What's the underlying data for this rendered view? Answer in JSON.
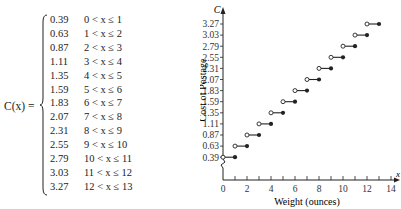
{
  "formula": {
    "lhs": "C(x) =",
    "cases": [
      {
        "value": "0.39",
        "condition": "0 < x ≤ 1"
      },
      {
        "value": "0.63",
        "condition": "1 < x ≤ 2"
      },
      {
        "value": "0.87",
        "condition": "2 < x ≤ 3"
      },
      {
        "value": "1.11",
        "condition": "3 < x ≤ 4"
      },
      {
        "value": "1.35",
        "condition": "4 < x ≤ 5"
      },
      {
        "value": "1.59",
        "condition": "5 < x ≤ 6"
      },
      {
        "value": "1.83",
        "condition": "6 < x ≤ 7"
      },
      {
        "value": "2.07",
        "condition": "7 < x ≤ 8"
      },
      {
        "value": "2.31",
        "condition": "8 < x ≤ 9"
      },
      {
        "value": "2.55",
        "condition": "9 < x ≤ 10"
      },
      {
        "value": "2.79",
        "condition": "10 < x ≤ 11"
      },
      {
        "value": "3.03",
        "condition": "11 < x ≤ 12"
      },
      {
        "value": "3.27",
        "condition": "12 < x ≤ 13"
      }
    ]
  },
  "chart_data": {
    "type": "step",
    "title": "",
    "xlabel": "Weight (ounces)",
    "ylabel": "Cost of Postage",
    "y_axis_letter": "C",
    "x_axis_letter": "x",
    "xlim": [
      0,
      14
    ],
    "x_ticks": [
      0,
      2,
      4,
      6,
      8,
      10,
      12,
      14
    ],
    "x_minor_ticks": [
      1,
      3,
      5,
      7,
      9,
      11,
      13
    ],
    "y_ticks": [
      "0.39",
      "0.63",
      "0.87",
      "1.11",
      "1.35",
      "1.59",
      "1.83",
      "2.07",
      "2.31",
      "2.55",
      "2.79",
      "3.03",
      "3.27"
    ],
    "y_axis_break": true,
    "grid": false,
    "legend": null,
    "segments": [
      {
        "x_start": 0,
        "x_end": 1,
        "y": 0.39,
        "open_start": true,
        "closed_end": true
      },
      {
        "x_start": 1,
        "x_end": 2,
        "y": 0.63,
        "open_start": true,
        "closed_end": true
      },
      {
        "x_start": 2,
        "x_end": 3,
        "y": 0.87,
        "open_start": true,
        "closed_end": true
      },
      {
        "x_start": 3,
        "x_end": 4,
        "y": 1.11,
        "open_start": true,
        "closed_end": true
      },
      {
        "x_start": 4,
        "x_end": 5,
        "y": 1.35,
        "open_start": true,
        "closed_end": true
      },
      {
        "x_start": 5,
        "x_end": 6,
        "y": 1.59,
        "open_start": true,
        "closed_end": true
      },
      {
        "x_start": 6,
        "x_end": 7,
        "y": 1.83,
        "open_start": true,
        "closed_end": true
      },
      {
        "x_start": 7,
        "x_end": 8,
        "y": 2.07,
        "open_start": true,
        "closed_end": true
      },
      {
        "x_start": 8,
        "x_end": 9,
        "y": 2.31,
        "open_start": true,
        "closed_end": true
      },
      {
        "x_start": 9,
        "x_end": 10,
        "y": 2.55,
        "open_start": true,
        "closed_end": true
      },
      {
        "x_start": 10,
        "x_end": 11,
        "y": 2.79,
        "open_start": true,
        "closed_end": true
      },
      {
        "x_start": 11,
        "x_end": 12,
        "y": 3.03,
        "open_start": true,
        "closed_end": true
      },
      {
        "x_start": 12,
        "x_end": 13,
        "y": 3.27,
        "open_start": true,
        "closed_end": true
      }
    ]
  }
}
